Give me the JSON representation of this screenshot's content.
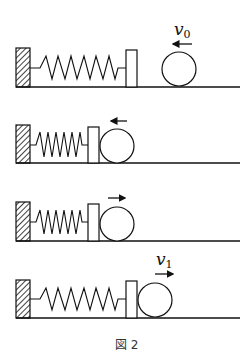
{
  "figure": {
    "caption": "図 2",
    "colors": {
      "stroke": "#111111",
      "background": "#ffffff"
    },
    "panels": [
      {
        "id": "panel-1",
        "description": "Ball approaches block with velocity v0 (moving left), spring at natural length",
        "velocity_label": {
          "symbol": "v",
          "subscript": "0"
        },
        "arrow_direction": "left"
      },
      {
        "id": "panel-2",
        "description": "Ball in contact with block, spring compressing, ball moving left",
        "arrow_direction": "left"
      },
      {
        "id": "panel-3",
        "description": "Ball in contact with block, spring compressed, ball moving right",
        "arrow_direction": "right"
      },
      {
        "id": "panel-4",
        "description": "Ball leaves block with velocity v1 (moving right), spring at natural length",
        "velocity_label": {
          "symbol": "v",
          "subscript": "1"
        },
        "arrow_direction": "right"
      }
    ]
  }
}
